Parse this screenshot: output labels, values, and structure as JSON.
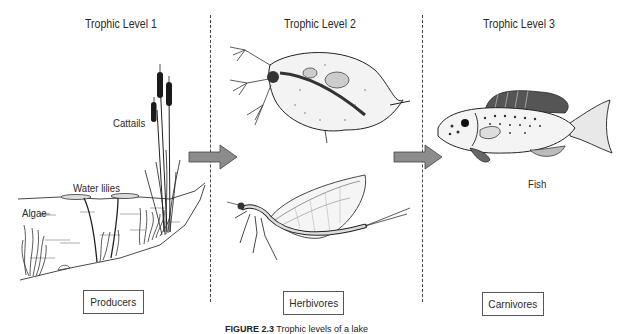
{
  "diagram": {
    "type": "food-chain-trophic-levels",
    "columns": [
      {
        "level_title": "Trophic Level 1",
        "category": "Producers",
        "organisms": [
          "Cattails",
          "Water lilies",
          "Algae"
        ]
      },
      {
        "level_title": "Trophic Level 2",
        "category": "Herbivores",
        "organisms": [
          "Water flea",
          "Mayfly"
        ]
      },
      {
        "level_title": "Trophic Level 3",
        "category": "Carnivores",
        "organisms": [
          "Fish"
        ]
      }
    ],
    "arrows": [
      {
        "from": "Trophic Level 1",
        "to": "Trophic Level 2",
        "color": "#8c8c8c"
      },
      {
        "from": "Trophic Level 2",
        "to": "Trophic Level 3",
        "color": "#8c8c8c"
      }
    ],
    "labels": {
      "cattails": "Cattails",
      "water_lilies": "Water lilies",
      "algae": "Algae",
      "fish": "Fish"
    },
    "caption": {
      "figure_number": "FIGURE 2.3",
      "text": "Trophic levels of a lake"
    },
    "colors": {
      "arrow_fill": "#8c8c8c",
      "arrow_stroke": "#444444",
      "divider": "#444444",
      "box_border": "#555555"
    }
  }
}
